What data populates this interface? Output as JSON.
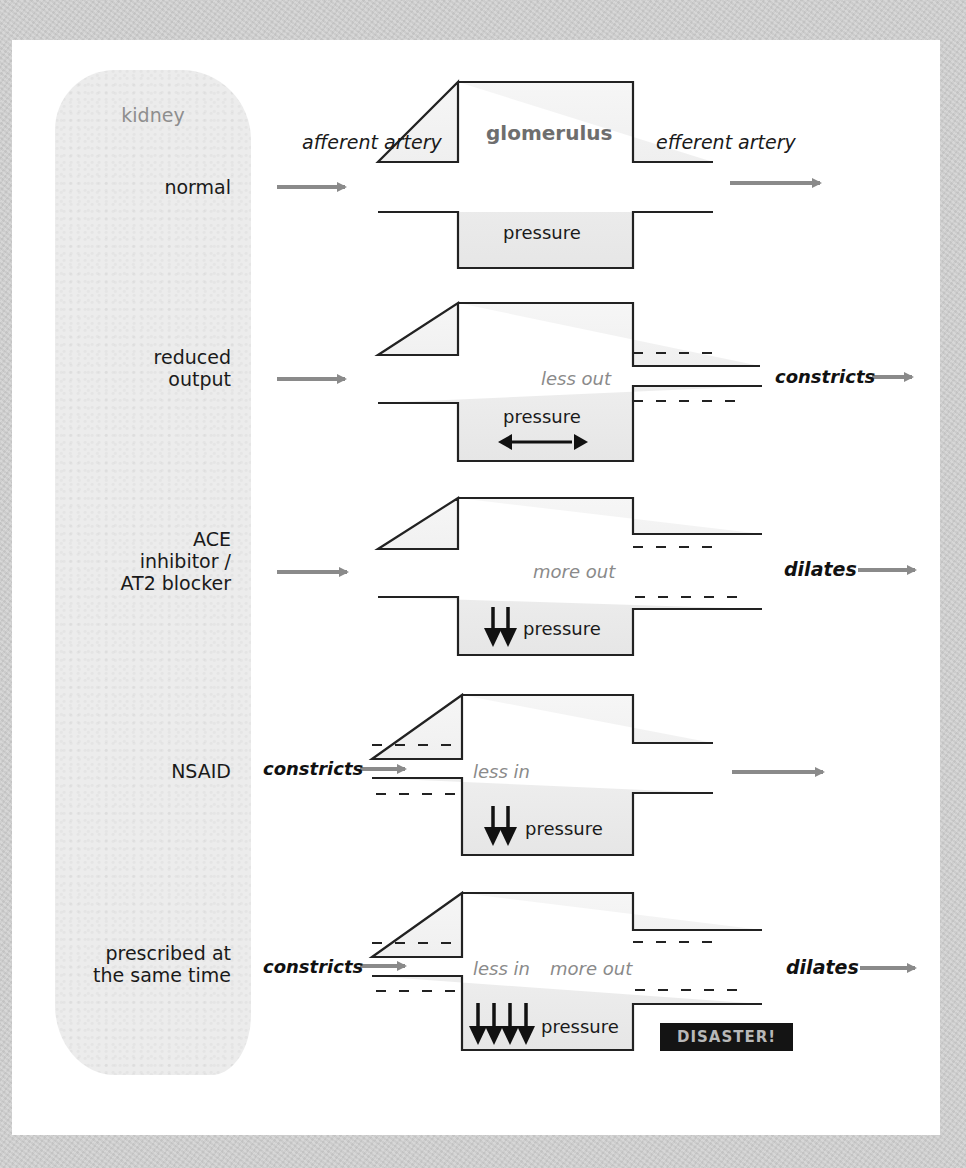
{
  "figure": {
    "sidebar_title": "kidney",
    "column_headers": {
      "inlet": "afferent artery",
      "chamber": "glomerulus",
      "outlet": "efferent artery"
    },
    "rows": [
      {
        "label_lines": [
          "normal"
        ],
        "inlet_note": "",
        "chamber_notes": [],
        "pressure_label": "pressure",
        "pressure_indicator": "none",
        "outlet_note": "",
        "badge": ""
      },
      {
        "label_lines": [
          "reduced",
          "output"
        ],
        "inlet_note": "",
        "chamber_notes": [
          "less out"
        ],
        "pressure_label": "pressure",
        "pressure_indicator": "double-headed-arrow",
        "outlet_note": "constricts",
        "badge": ""
      },
      {
        "label_lines": [
          "ACE",
          "inhibitor /",
          "AT2 blocker"
        ],
        "inlet_note": "",
        "chamber_notes": [
          "more out"
        ],
        "pressure_label": "pressure",
        "pressure_indicator": "2-down-arrows",
        "outlet_note": "dilates",
        "badge": ""
      },
      {
        "label_lines": [
          "NSAID"
        ],
        "inlet_note": "constricts",
        "chamber_notes": [
          "less in"
        ],
        "pressure_label": "pressure",
        "pressure_indicator": "2-down-arrows",
        "outlet_note": "",
        "badge": ""
      },
      {
        "label_lines": [
          "prescribed at",
          "the same time"
        ],
        "inlet_note": "constricts",
        "chamber_notes": [
          "less in",
          "more out"
        ],
        "pressure_label": "pressure",
        "pressure_indicator": "4-down-arrows",
        "outlet_note": "dilates",
        "badge": "DISASTER!"
      }
    ],
    "colors": {
      "background": "#cfcfcf",
      "card": "#ffffff",
      "kidney_fill": "#ececec",
      "flow_arrow": "#8a8a8a",
      "outline": "#222222",
      "badge_bg": "#141414",
      "badge_text": "#b8b8b8"
    }
  }
}
